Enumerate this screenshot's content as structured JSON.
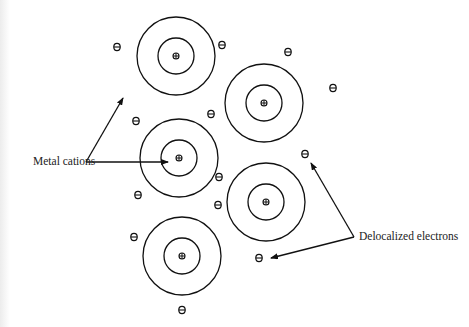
{
  "diagram": {
    "type": "metallic bonding model",
    "colors": {
      "stroke": "#111111",
      "background": "#ffffff",
      "text": "#222222"
    },
    "labels": {
      "cations": "Metal cations",
      "electrons": "Delocalized electrons"
    },
    "cation_symbol": "⊕",
    "electron_symbol": "⊖",
    "cations": [
      {
        "cx": 176,
        "cy": 56,
        "r_outer": 39,
        "r_inner": 18
      },
      {
        "cx": 264,
        "cy": 103,
        "r_outer": 39,
        "r_inner": 18
      },
      {
        "cx": 179,
        "cy": 158,
        "r_outer": 39,
        "r_inner": 18
      },
      {
        "cx": 266,
        "cy": 202,
        "r_outer": 39,
        "r_inner": 18
      },
      {
        "cx": 182,
        "cy": 256,
        "r_outer": 39,
        "r_inner": 18
      }
    ],
    "electrons": [
      {
        "x": 117,
        "y": 47
      },
      {
        "x": 222,
        "y": 45
      },
      {
        "x": 288,
        "y": 52
      },
      {
        "x": 333,
        "y": 88
      },
      {
        "x": 136,
        "y": 121
      },
      {
        "x": 211,
        "y": 114
      },
      {
        "x": 305,
        "y": 154
      },
      {
        "x": 138,
        "y": 195
      },
      {
        "x": 219,
        "y": 177
      },
      {
        "x": 218,
        "y": 205
      },
      {
        "x": 259,
        "y": 258
      },
      {
        "x": 134,
        "y": 237
      },
      {
        "x": 182,
        "y": 310
      }
    ],
    "arrows": [
      {
        "from": [
          86,
          162
        ],
        "to": [
          123,
          98
        ]
      },
      {
        "from": [
          86,
          162
        ],
        "to": [
          168,
          162
        ]
      },
      {
        "from": [
          354,
          237
        ],
        "to": [
          311,
          163
        ]
      },
      {
        "from": [
          354,
          237
        ],
        "to": [
          271,
          258
        ]
      }
    ]
  }
}
